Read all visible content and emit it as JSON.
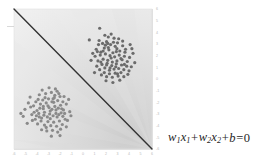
{
  "figure": {
    "name": "linear-classifier-decision-boundary",
    "background_color": "#ffffff"
  },
  "annotation": {
    "equation_full": "w1x1 + w2x2 + b = 0",
    "w_symbol": "w",
    "x_symbol": "x",
    "b_symbol": "b",
    "sub_1": "1",
    "sub_2": "2",
    "plus": "+",
    "equals": "=",
    "zero": "0",
    "color": "#262626"
  },
  "chart_data": {
    "type": "scatter",
    "title": "",
    "xlabel": "",
    "ylabel": "",
    "xlim": [
      -6,
      6
    ],
    "ylim": [
      -6,
      6
    ],
    "grid": false,
    "legend": null,
    "x_ticks": [
      -6,
      -5,
      -4,
      -3,
      -2,
      -1,
      0,
      1,
      2,
      3,
      4,
      5,
      6
    ],
    "y_ticks": [
      -6,
      -5,
      -4,
      -3,
      -2,
      -1,
      0,
      1,
      2,
      3,
      4,
      5,
      6
    ],
    "x_tick_labels": [
      "-6",
      "-5",
      "-4",
      "-3",
      "-2",
      "-1",
      "0",
      "1",
      "2",
      "3",
      "4",
      "5",
      "6"
    ],
    "y_tick_labels": [
      "6",
      "5",
      "4",
      "3",
      "2",
      "1",
      "0",
      "-1",
      "-2",
      "-3",
      "-4",
      "-5",
      "-6"
    ],
    "tick_label_color": "#b9b9b9",
    "axis_position": "right-and-bottom",
    "background_fill": "light-gray-radial-gradient",
    "background_colors": [
      "#ececec",
      "#e3e3e3",
      "#d9d9d9",
      "#cfcfcf"
    ],
    "decision_boundary": {
      "name": "decision-boundary-line",
      "equation": "w1x1 + w2x2 + b = 0",
      "from": [
        -6,
        6
      ],
      "to": [
        6,
        -6
      ],
      "slope": -1,
      "intercept": 0,
      "color": "#333333",
      "width": 1.4
    },
    "series": [
      {
        "name": "class-positive-cluster",
        "label": "",
        "marker": "circle",
        "color": "#6b6b6b",
        "size": 1.6,
        "center": [
          2.0,
          2.2
        ],
        "points": [
          [
            0.55,
            3.35
          ],
          [
            1.15,
            2.55
          ],
          [
            1.35,
            2.95
          ],
          [
            1.55,
            2.3
          ],
          [
            1.7,
            3.05
          ],
          [
            1.85,
            2.65
          ],
          [
            2.05,
            3.2
          ],
          [
            2.25,
            2.5
          ],
          [
            2.4,
            2.95
          ],
          [
            2.6,
            2.25
          ],
          [
            2.8,
            2.8
          ],
          [
            3.0,
            3.1
          ],
          [
            3.2,
            2.4
          ],
          [
            3.45,
            2.85
          ],
          [
            3.65,
            2.3
          ],
          [
            1.05,
            1.95
          ],
          [
            1.3,
            1.55
          ],
          [
            1.5,
            2.05
          ],
          [
            1.75,
            1.7
          ],
          [
            1.95,
            2.15
          ],
          [
            2.15,
            1.6
          ],
          [
            2.35,
            2.0
          ],
          [
            2.55,
            1.45
          ],
          [
            2.75,
            1.9
          ],
          [
            2.95,
            1.55
          ],
          [
            3.15,
            2.05
          ],
          [
            3.4,
            1.65
          ],
          [
            3.6,
            1.95
          ],
          [
            3.85,
            1.5
          ],
          [
            4.05,
            1.85
          ],
          [
            1.2,
            1.1
          ],
          [
            1.45,
            0.8
          ],
          [
            1.65,
            1.25
          ],
          [
            1.9,
            0.95
          ],
          [
            2.1,
            1.35
          ],
          [
            2.3,
            0.75
          ],
          [
            2.5,
            1.15
          ],
          [
            2.7,
            0.85
          ],
          [
            2.9,
            1.3
          ],
          [
            3.1,
            0.9
          ],
          [
            3.35,
            1.2
          ],
          [
            3.55,
            0.8
          ],
          [
            3.8,
            1.1
          ],
          [
            4.0,
            0.7
          ],
          [
            4.2,
            1.05
          ],
          [
            1.6,
            0.35
          ],
          [
            1.85,
            0.55
          ],
          [
            2.05,
            0.2
          ],
          [
            2.3,
            0.45
          ],
          [
            2.55,
            0.15
          ],
          [
            2.8,
            0.5
          ],
          [
            3.05,
            0.25
          ],
          [
            3.3,
            0.55
          ],
          [
            3.55,
            0.2
          ],
          [
            3.9,
            0.4
          ],
          [
            2.2,
            3.6
          ],
          [
            2.7,
            3.5
          ],
          [
            3.1,
            3.45
          ],
          [
            1.9,
            3.75
          ],
          [
            2.45,
            3.85
          ],
          [
            1.45,
            4.35
          ],
          [
            4.35,
            2.2
          ],
          [
            4.5,
            1.4
          ],
          [
            4.25,
            2.6
          ],
          [
            0.85,
            2.2
          ],
          [
            0.7,
            1.6
          ],
          [
            1.0,
            0.55
          ],
          [
            2.0,
            -0.15
          ],
          [
            2.6,
            -0.3
          ],
          [
            3.2,
            -0.1
          ],
          [
            1.75,
            2.4
          ],
          [
            2.45,
            1.8
          ],
          [
            2.2,
            2.7
          ],
          [
            2.9,
            2.35
          ],
          [
            3.3,
            1.75
          ],
          [
            1.4,
            3.3
          ],
          [
            2.05,
            1.2
          ],
          [
            2.85,
            1.05
          ],
          [
            3.7,
            2.55
          ],
          [
            4.1,
            2.95
          ],
          [
            1.25,
            2.35
          ],
          [
            1.95,
            2.9
          ],
          [
            2.65,
            3.15
          ],
          [
            3.45,
            3.25
          ],
          [
            2.35,
            0.95
          ],
          [
            3.0,
            0.45
          ],
          [
            1.55,
            1.45
          ],
          [
            2.15,
            3.05
          ],
          [
            2.95,
            2.6
          ],
          [
            3.6,
            1.25
          ]
        ]
      },
      {
        "name": "class-negative-cluster",
        "label": "",
        "marker": "circle",
        "color": "#8a8a8a",
        "size": 1.6,
        "center": [
          -2.6,
          -2.3
        ],
        "points": [
          [
            -4.6,
            -1.55
          ],
          [
            -4.1,
            -1.95
          ],
          [
            -3.8,
            -1.35
          ],
          [
            -3.5,
            -1.8
          ],
          [
            -3.25,
            -1.25
          ],
          [
            -3.0,
            -1.7
          ],
          [
            -2.75,
            -1.15
          ],
          [
            -2.5,
            -1.6
          ],
          [
            -2.25,
            -1.05
          ],
          [
            -2.0,
            -1.5
          ],
          [
            -1.75,
            -1.95
          ],
          [
            -4.3,
            -2.3
          ],
          [
            -4.0,
            -2.7
          ],
          [
            -3.7,
            -2.15
          ],
          [
            -3.45,
            -2.55
          ],
          [
            -3.2,
            -2.05
          ],
          [
            -2.95,
            -2.45
          ],
          [
            -2.7,
            -1.95
          ],
          [
            -2.45,
            -2.35
          ],
          [
            -2.2,
            -1.85
          ],
          [
            -1.95,
            -2.25
          ],
          [
            -1.7,
            -2.65
          ],
          [
            -1.45,
            -2.15
          ],
          [
            -4.45,
            -3.05
          ],
          [
            -4.15,
            -3.45
          ],
          [
            -3.85,
            -2.95
          ],
          [
            -3.6,
            -3.35
          ],
          [
            -3.35,
            -2.85
          ],
          [
            -3.1,
            -3.25
          ],
          [
            -2.85,
            -2.75
          ],
          [
            -2.6,
            -3.15
          ],
          [
            -2.35,
            -2.65
          ],
          [
            -2.1,
            -3.05
          ],
          [
            -1.85,
            -2.55
          ],
          [
            -1.6,
            -2.95
          ],
          [
            -3.95,
            -3.85
          ],
          [
            -3.65,
            -3.6
          ],
          [
            -3.35,
            -3.95
          ],
          [
            -3.05,
            -3.65
          ],
          [
            -2.8,
            -4.0
          ],
          [
            -2.55,
            -3.7
          ],
          [
            -2.3,
            -4.05
          ],
          [
            -2.05,
            -3.6
          ],
          [
            -1.8,
            -3.9
          ],
          [
            -1.55,
            -3.45
          ],
          [
            -3.15,
            -4.45
          ],
          [
            -2.65,
            -4.4
          ],
          [
            -2.2,
            -4.55
          ],
          [
            -1.95,
            -4.3
          ],
          [
            -5.05,
            -2.6
          ],
          [
            -5.2,
            -3.2
          ],
          [
            -4.85,
            -3.8
          ],
          [
            -1.25,
            -1.75
          ],
          [
            -1.15,
            -2.8
          ],
          [
            -1.35,
            -3.55
          ],
          [
            -2.95,
            -0.75
          ],
          [
            -2.4,
            -0.85
          ],
          [
            -3.55,
            -0.95
          ],
          [
            -2.1,
            -1.25
          ],
          [
            -4.75,
            -2.05
          ],
          [
            -3.05,
            -2.3
          ],
          [
            -2.55,
            -2.0
          ],
          [
            -2.85,
            -3.4
          ],
          [
            -3.4,
            -3.1
          ],
          [
            -2.25,
            -3.25
          ],
          [
            -1.9,
            -2.9
          ],
          [
            -3.75,
            -2.5
          ],
          [
            -4.25,
            -2.85
          ],
          [
            -2.7,
            -2.6
          ],
          [
            -3.3,
            -1.6
          ],
          [
            -2.45,
            -1.4
          ],
          [
            -1.65,
            -1.5
          ],
          [
            -3.9,
            -1.75
          ],
          [
            -4.4,
            -3.55
          ],
          [
            -3.2,
            -4.15
          ],
          [
            -2.0,
            -4.85
          ],
          [
            -2.75,
            -4.9
          ],
          [
            -1.45,
            -4.1
          ],
          [
            -5.4,
            -2.95
          ],
          [
            -1.05,
            -3.15
          ],
          [
            -3.6,
            -4.35
          ],
          [
            -2.9,
            -3.0
          ],
          [
            -2.35,
            -2.95
          ],
          [
            -3.45,
            -2.35
          ],
          [
            -4.05,
            -3.15
          ],
          [
            -2.15,
            -2.5
          ],
          [
            -1.75,
            -3.2
          ],
          [
            -3.8,
            -3.25
          ],
          [
            -2.6,
            -1.7
          ],
          [
            -4.55,
            -2.4
          ]
        ]
      }
    ]
  }
}
